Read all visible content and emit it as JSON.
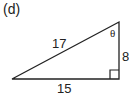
{
  "figure": {
    "label": "(d)",
    "hypotenuse": "17",
    "angle": "θ",
    "vertical_side": "8",
    "horizontal_side": "15"
  }
}
